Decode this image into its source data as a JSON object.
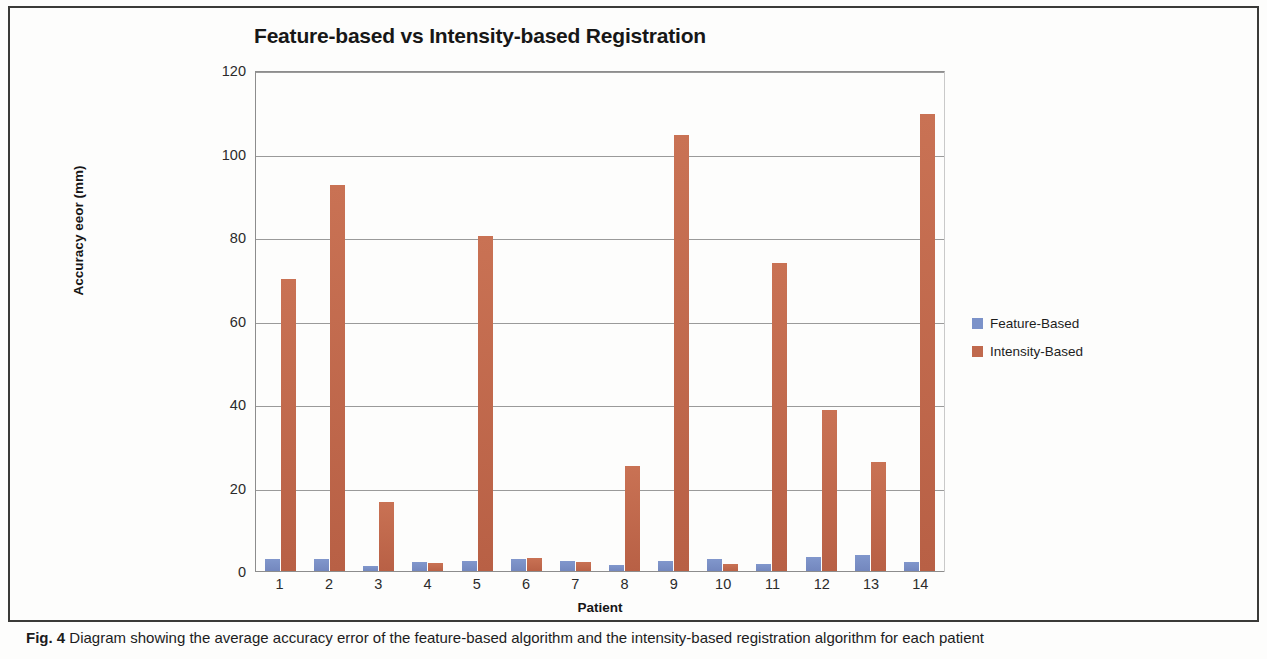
{
  "figure": {
    "caption_label": "Fig. 4",
    "caption_text": "Diagram showing the average accuracy error of the feature-based algorithm and the intensity-based registration algorithm for each patient"
  },
  "legend": {
    "entries": [
      {
        "label": "Feature-Based",
        "color": "#7b92c9"
      },
      {
        "label": "Intensity-Based",
        "color": "#c0694d"
      }
    ]
  },
  "axes": {
    "y_ticks": [
      "0",
      "20",
      "40",
      "60",
      "80",
      "100",
      "120"
    ],
    "x_ticks": [
      "1",
      "2",
      "3",
      "4",
      "5",
      "6",
      "7",
      "8",
      "9",
      "10",
      "11",
      "12",
      "13",
      "14"
    ]
  },
  "chart_data": {
    "type": "bar",
    "title": "Feature-based vs Intensity-based Registration",
    "xlabel": "Patient",
    "ylabel": "Accuracy eeor (mm)",
    "categories": [
      "1",
      "2",
      "3",
      "4",
      "5",
      "6",
      "7",
      "8",
      "9",
      "10",
      "11",
      "12",
      "13",
      "14"
    ],
    "series": [
      {
        "name": "Feature-Based",
        "color": "#7b92c9",
        "values": [
          3.2,
          3.1,
          1.5,
          2.3,
          2.7,
          3.2,
          2.6,
          1.7,
          2.6,
          3.2,
          2.0,
          3.6,
          4.0,
          2.4
        ]
      },
      {
        "name": "Intensity-Based",
        "color": "#c0694d",
        "values": [
          70.3,
          92.7,
          16.8,
          2.2,
          80.6,
          3.3,
          2.5,
          25.5,
          104.7,
          2.0,
          73.9,
          38.7,
          26.4,
          109.8
        ]
      }
    ],
    "ylim": [
      0,
      120
    ],
    "ytick_step": 20,
    "grid": true,
    "legend_position": "right"
  }
}
